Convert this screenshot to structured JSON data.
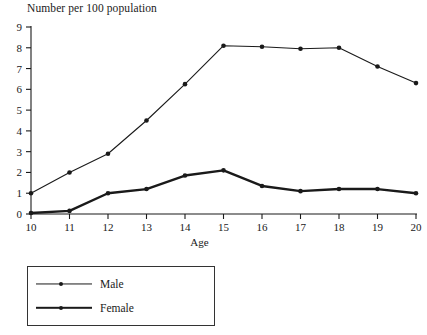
{
  "chart_data": {
    "type": "line",
    "title": "Number per 100 population",
    "xlabel": "Age",
    "ylabel": "",
    "x": [
      10,
      11,
      12,
      13,
      14,
      15,
      16,
      17,
      18,
      19,
      20
    ],
    "xtick_labels": [
      "10",
      "11",
      "12",
      "13",
      "14",
      "15",
      "16",
      "17",
      "18",
      "19",
      "20"
    ],
    "ytick_labels": [
      "0",
      "1",
      "2",
      "3",
      "4",
      "5",
      "6",
      "7",
      "8",
      "9"
    ],
    "xlim": [
      10,
      20
    ],
    "ylim": [
      0,
      9
    ],
    "grid": false,
    "legend_position": "below-left",
    "series": [
      {
        "name": "Male",
        "values": [
          1.0,
          2.0,
          2.9,
          4.5,
          6.25,
          8.1,
          8.05,
          7.95,
          8.0,
          7.1,
          6.3
        ],
        "line_width": "thin",
        "color": "#1a1a1a"
      },
      {
        "name": "Female",
        "values": [
          0.05,
          0.15,
          1.0,
          1.2,
          1.85,
          2.1,
          1.35,
          1.1,
          1.2,
          1.2,
          1.0
        ],
        "line_width": "thick",
        "color": "#1a1a1a"
      }
    ]
  },
  "legend": {
    "items": [
      {
        "label": "Male"
      },
      {
        "label": "Female"
      }
    ]
  }
}
